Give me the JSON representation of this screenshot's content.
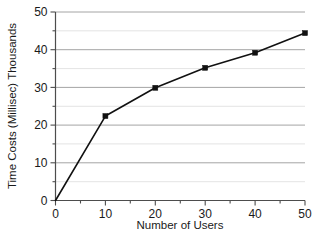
{
  "chart_data": {
    "type": "line",
    "title": "",
    "xlabel": "Number of Users",
    "ylabel": "Time Costs (Millisec) Thousands",
    "xlim": [
      0,
      50
    ],
    "ylim": [
      0,
      50
    ],
    "x_ticks": [
      0,
      10,
      20,
      30,
      40,
      50
    ],
    "y_ticks": [
      0,
      10,
      20,
      30,
      40,
      50
    ],
    "x_tick_labels": [
      "0",
      "10",
      "20",
      "30",
      "40",
      "50"
    ],
    "y_tick_labels": [
      "0",
      "10",
      "20",
      "30",
      "40",
      "50"
    ],
    "x_minor_tick_step": 5,
    "y_minor_tick_step": 5,
    "grid": {
      "horizontal_major": true,
      "horizontal_minor": true,
      "vertical": false,
      "major_color": "#9a9a9a",
      "minor_color": "#dcdcdc"
    },
    "legend": {
      "visible": false,
      "position": "none"
    },
    "marker": {
      "shape": "square",
      "size": 5,
      "color": "#111111"
    },
    "line_color": "#111111",
    "x": [
      0,
      10,
      20,
      30,
      40,
      50
    ],
    "values": [
      0,
      22.4,
      29.9,
      35.2,
      39.2,
      44.4
    ],
    "series": [
      {
        "name": "Time Costs",
        "points": [
          {
            "x": 0,
            "y": 0
          },
          {
            "x": 10,
            "y": 22.4
          },
          {
            "x": 20,
            "y": 29.9
          },
          {
            "x": 30,
            "y": 35.2
          },
          {
            "x": 40,
            "y": 39.2
          },
          {
            "x": 50,
            "y": 44.4
          }
        ]
      }
    ]
  },
  "axis": {
    "x_title": "Number of Users",
    "y_title": "Time Costs (Millisec) Thousands",
    "x_labels": [
      "0",
      "10",
      "20",
      "30",
      "40",
      "50"
    ],
    "y_labels": [
      "0",
      "10",
      "20",
      "30",
      "40",
      "50"
    ]
  }
}
